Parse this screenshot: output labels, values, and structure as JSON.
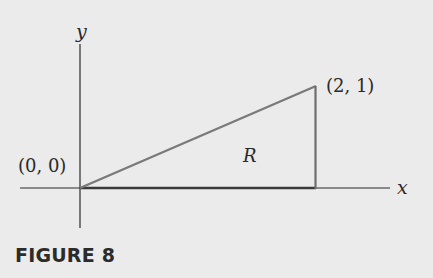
{
  "figure": {
    "caption": "FIGURE 8",
    "axes": {
      "x_label": "x",
      "y_label": "y"
    },
    "points": [
      {
        "label": "(0, 0)",
        "x": 0,
        "y": 0
      },
      {
        "label": "(2, 1)",
        "x": 2,
        "y": 1
      }
    ],
    "region_label": "R",
    "region_vertices": [
      [
        0,
        0
      ],
      [
        2,
        1
      ],
      [
        2,
        0
      ]
    ],
    "colors": {
      "axes": "#2a2a2a",
      "region_edge": "#7a7a7a",
      "region_base": "#3a3a3a",
      "background": "#ebebeb"
    }
  }
}
